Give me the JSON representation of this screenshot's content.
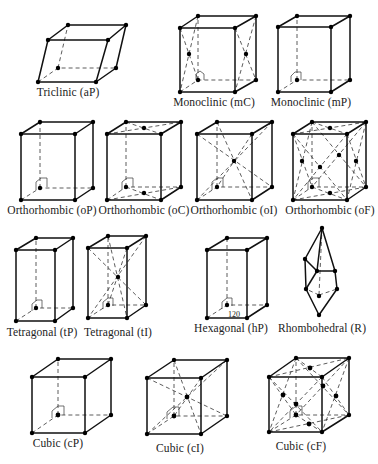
{
  "diagram": {
    "cells": [
      {
        "id": "aP",
        "label": "Triclinic  (aP)"
      },
      {
        "id": "mC",
        "label": "Monoclinic  (mC)"
      },
      {
        "id": "mP",
        "label": "Monoclinic  (mP)"
      },
      {
        "id": "oP",
        "label": "Orthorhombic  (oP)"
      },
      {
        "id": "oC",
        "label": "Orthorhombic  (oC)"
      },
      {
        "id": "oI",
        "label": "Orthorhombic  (oI)"
      },
      {
        "id": "oF",
        "label": "Orthorhombic  (oF)"
      },
      {
        "id": "tP",
        "label": "Tetragonal  (tP)"
      },
      {
        "id": "tI",
        "label": "Tetragonal  (tI)"
      },
      {
        "id": "hP",
        "label": "Hexagonal  (hP)"
      },
      {
        "id": "R",
        "label": "Rhombohedral  (R)"
      },
      {
        "id": "cP",
        "label": "Cubic  (cP)"
      },
      {
        "id": "cI",
        "label": "Cubic  (cI)"
      },
      {
        "id": "cF",
        "label": "Cubic  (cF)"
      }
    ],
    "hex_angle_label": "120"
  }
}
